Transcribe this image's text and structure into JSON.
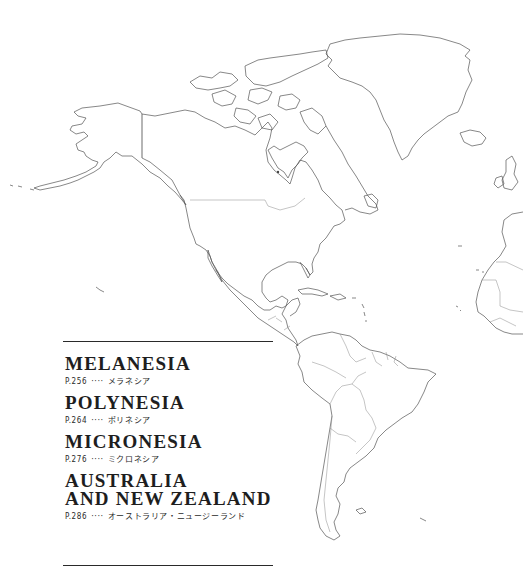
{
  "map": {
    "regions_drawn": [
      "North America",
      "Greenland",
      "Central America",
      "Caribbean",
      "South America",
      "Iceland",
      "British Isles",
      "Iberia",
      "West Africa"
    ]
  },
  "toc": {
    "entries": [
      {
        "title": "MELANESIA",
        "page": "P.256",
        "leader": "····",
        "japanese": "メラネシア"
      },
      {
        "title": "POLYNESIA",
        "page": "P.264",
        "leader": "····",
        "japanese": "ポリネシア"
      },
      {
        "title": "MICRONESIA",
        "page": "P.276",
        "leader": "····",
        "japanese": "ミクロネシア"
      },
      {
        "title_line1": "AUSTRALIA",
        "title_line2": "AND NEW ZEALAND",
        "page": "P.286",
        "leader": "····",
        "japanese": "オーストラリア・ニュージーランド"
      }
    ]
  }
}
